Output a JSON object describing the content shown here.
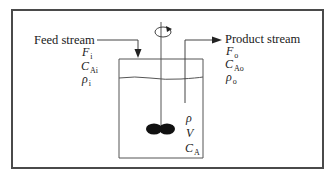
{
  "diagram": {
    "type": "continuous stirred tank reactor schematic",
    "feed": {
      "title": "Feed stream",
      "vars": [
        {
          "sym": "F",
          "sub": "i"
        },
        {
          "sym": "C",
          "sub": "Ai"
        },
        {
          "sym": "ρ",
          "sub": "i"
        }
      ]
    },
    "product": {
      "title": "Product stream",
      "vars": [
        {
          "sym": "F",
          "sub": "o"
        },
        {
          "sym": "C",
          "sub": "Ao"
        },
        {
          "sym": "ρ",
          "sub": "o"
        }
      ]
    },
    "tank": {
      "vars": [
        {
          "sym": "ρ",
          "sub": ""
        },
        {
          "sym": "V",
          "sub": ""
        },
        {
          "sym": "C",
          "sub": "A"
        }
      ]
    },
    "colors": {
      "line": "#3a3a3a",
      "frame": "#4a4a4a",
      "impeller": "#111111",
      "background": "#ffffff"
    }
  }
}
